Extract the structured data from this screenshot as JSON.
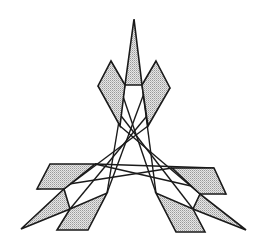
{
  "diagram": {
    "colors": {
      "stroke": "#1a1a1a",
      "fill": "#d4d4d4",
      "background": "#ffffff"
    },
    "shapes": [
      {
        "name": "top-spike",
        "points": "134,19 142,85 125,85"
      },
      {
        "name": "top-left-diamond",
        "points": "111,61 125,85 120,126 98,86"
      },
      {
        "name": "top-right-diamond",
        "points": "156,61 170,88 148,126 142,85"
      },
      {
        "name": "left-upper-parallelogram",
        "points": "50,164 95,164 64,189 37,189"
      },
      {
        "name": "left-spike",
        "points": "21,229 64,189 70,209"
      },
      {
        "name": "left-lower-parallelogram",
        "points": "70,209 107,193 88,230 57,230"
      },
      {
        "name": "right-upper-parallelogram",
        "points": "172,168 214,168 226,194 200,194"
      },
      {
        "name": "right-spike",
        "points": "246,230 200,194 193,209"
      },
      {
        "name": "right-lower-parallelogram",
        "points": "193,209 156,193 176,232 205,232"
      }
    ],
    "lines": [
      {
        "name": "cross-line-1",
        "points": "125,85 107,193"
      },
      {
        "name": "cross-line-2",
        "points": "142,85 156,193"
      },
      {
        "name": "cross-line-3",
        "points": "120,126 200,194"
      },
      {
        "name": "cross-line-4",
        "points": "148,126 64,189"
      },
      {
        "name": "cross-line-5",
        "points": "95,164 214,168"
      },
      {
        "name": "cross-line-6",
        "points": "98,86 193,209"
      },
      {
        "name": "cross-line-7",
        "points": "170,88 70,209"
      },
      {
        "name": "cross-line-8",
        "points": "95,164 226,194"
      },
      {
        "name": "cross-line-9",
        "points": "172,168 37,189"
      },
      {
        "name": "cross-line-10",
        "points": "111,61 156,193"
      },
      {
        "name": "cross-line-11",
        "points": "156,61 107,193"
      }
    ]
  }
}
